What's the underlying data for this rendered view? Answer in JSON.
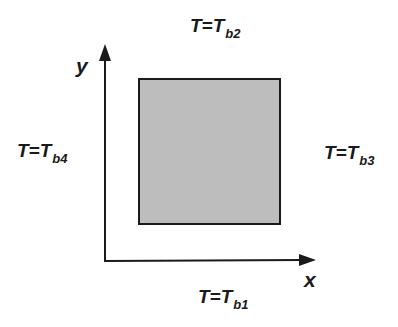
{
  "diagram": {
    "domain_fill": "#bdbdbd",
    "stroke": "#1a1a1a",
    "axes": {
      "x_label": "x",
      "y_label": "y"
    },
    "boundaries": {
      "top": {
        "prefix": "T=T",
        "sub": "b2"
      },
      "left": {
        "prefix": "T=T",
        "sub": "b4"
      },
      "right": {
        "prefix": "T=T",
        "sub": "b3"
      },
      "bottom": {
        "prefix": "T=T",
        "sub": "b1"
      }
    }
  }
}
